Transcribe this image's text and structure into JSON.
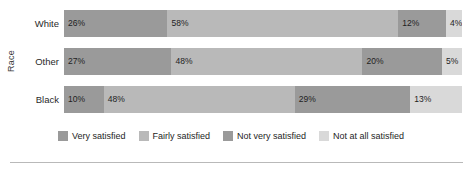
{
  "chart_data": {
    "type": "bar",
    "subtype": "stacked-horizontal-100pct",
    "title": "",
    "xlabel": "",
    "ylabel": "Race",
    "categories": [
      "White",
      "Other",
      "Black"
    ],
    "series": [
      {
        "name": "Very satisfied",
        "color": "#9a9a9a",
        "values": [
          26,
          27,
          10
        ]
      },
      {
        "name": "Fairly satisfied",
        "color": "#b9b9b9",
        "values": [
          58,
          48,
          48
        ]
      },
      {
        "name": "Not very satisfied",
        "color": "#9a9a9a",
        "values": [
          12,
          20,
          29
        ]
      },
      {
        "name": "Not at all satisfied",
        "color": "#d9d9d9",
        "values": [
          4,
          5,
          13
        ]
      }
    ],
    "value_suffix": "%",
    "xlim": [
      0,
      100
    ],
    "grid": false,
    "legend_position": "bottom"
  },
  "axis": {
    "y_title": "Race"
  },
  "rows": [
    {
      "label": "White",
      "segments": [
        {
          "label": "26%",
          "pct": 26,
          "color": "#9a9a9a"
        },
        {
          "label": "58%",
          "pct": 58,
          "color": "#b9b9b9"
        },
        {
          "label": "12%",
          "pct": 12,
          "color": "#9a9a9a"
        },
        {
          "label": "4%",
          "pct": 4,
          "color": "#d9d9d9"
        }
      ]
    },
    {
      "label": "Other",
      "segments": [
        {
          "label": "27%",
          "pct": 27,
          "color": "#9a9a9a"
        },
        {
          "label": "48%",
          "pct": 48,
          "color": "#b9b9b9"
        },
        {
          "label": "20%",
          "pct": 20,
          "color": "#9a9a9a"
        },
        {
          "label": "5%",
          "pct": 5,
          "color": "#d9d9d9"
        }
      ]
    },
    {
      "label": "Black",
      "segments": [
        {
          "label": "10%",
          "pct": 10,
          "color": "#9a9a9a"
        },
        {
          "label": "48%",
          "pct": 48,
          "color": "#b9b9b9"
        },
        {
          "label": "29%",
          "pct": 29,
          "color": "#9a9a9a"
        },
        {
          "label": "13%",
          "pct": 13,
          "color": "#d9d9d9"
        }
      ]
    }
  ],
  "legend": {
    "items": [
      {
        "label": "Very satisfied",
        "color": "#9a9a9a"
      },
      {
        "label": "Fairly satisfied",
        "color": "#b9b9b9"
      },
      {
        "label": "Not very satisfied",
        "color": "#9a9a9a"
      },
      {
        "label": "Not at all satisfied",
        "color": "#d9d9d9"
      }
    ]
  }
}
